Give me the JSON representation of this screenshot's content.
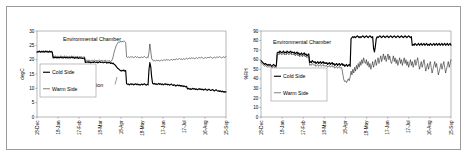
{
  "figure": {
    "title": "",
    "panels": [
      "temperature",
      "humidity"
    ]
  },
  "chart_data": [
    {
      "id": "temperature",
      "type": "line",
      "title": "",
      "annotation_chamber": "Environmental Chamber",
      "annotation_event": "Add partition",
      "xlabel": "",
      "ylabel": "degC",
      "ylim": [
        0,
        30
      ],
      "yticks": [
        0,
        5,
        10,
        15,
        20,
        25,
        30
      ],
      "ytick_labels": [
        "0",
        "5",
        "10",
        "15",
        "20",
        "25",
        "30"
      ],
      "xtick_labels": [
        "18-Dec",
        "18-Jan",
        "17-Feb",
        "18-Mar",
        "18-Apr",
        "18-May",
        "17-Jun",
        "17-Jul",
        "16-Aug",
        "15-Sep"
      ],
      "grid": false,
      "legend_position": "center-left",
      "series": [
        {
          "name": "Cold Side",
          "style": "thick",
          "values": [
            22.6,
            22.8,
            22.7,
            22.9,
            22.6,
            22.8,
            22.7,
            22.9,
            22.6,
            22.8,
            22.9,
            22.7,
            22.8,
            22.6,
            22.9,
            22.7,
            22.8,
            22.6,
            20.6,
            20.8,
            20.7,
            20.9,
            20.6,
            20.8,
            20.7,
            20.6,
            20.9,
            20.7,
            20.8,
            20.6,
            20.7,
            20.9,
            20.6,
            20.8,
            20.7,
            20.6,
            20.8,
            20.6,
            20.7,
            20.9,
            20.6,
            20.8,
            20.5,
            20.7,
            20.6,
            20.8,
            20.4,
            20.6,
            20.7,
            20.5,
            20.6,
            20.4,
            20.5,
            20.6,
            19.0,
            19.2,
            19.1,
            19.3,
            19.0,
            19.2,
            18.9,
            19.1,
            19.2,
            19.0,
            19.3,
            19.1,
            19.0,
            19.2,
            18.9,
            19.1,
            19.3,
            19.0,
            19.1,
            19.2,
            18.9,
            19.0,
            19.2,
            19.1,
            18.8,
            19.0,
            18.9,
            19.1,
            18.7,
            18.9,
            18.6,
            18.8,
            18.4,
            18.2,
            17.8,
            17.4,
            17.0,
            16.8,
            16.5,
            16.2,
            16.0,
            16.3,
            16.1,
            16.4,
            16.0,
            16.2,
            11.6,
            11.4,
            11.5,
            11.2,
            11.4,
            11.6,
            11.3,
            11.5,
            11.2,
            11.4,
            11.6,
            11.3,
            11.5,
            11.2,
            11.4,
            11.1,
            11.3,
            11.5,
            11.2,
            11.4,
            11.6,
            11.3,
            11.1,
            11.4,
            11.2,
            16.5,
            19.0,
            17.5,
            14.0,
            11.8,
            11.5,
            11.7,
            11.4,
            11.6,
            11.3,
            11.5,
            11.7,
            11.4,
            11.6,
            11.3,
            11.5,
            11.2,
            11.4,
            11.6,
            11.3,
            11.5,
            11.2,
            11.4,
            11.1,
            11.3,
            11.5,
            11.2,
            11.0,
            11.3,
            11.1,
            10.8,
            11.0,
            11.2,
            10.9,
            11.1,
            10.8,
            11.0,
            10.7,
            10.9,
            10.6,
            10.8,
            10.5,
            10.7,
            9.8,
            10.0,
            9.7,
            9.9,
            9.6,
            9.8,
            10.0,
            9.7,
            9.9,
            9.6,
            9.8,
            9.5,
            9.7,
            9.9,
            9.6,
            9.8,
            9.5,
            9.7,
            9.4,
            9.6,
            9.8,
            9.5,
            9.3,
            9.5,
            9.7,
            9.4,
            9.2,
            9.4,
            9.6,
            9.3,
            9.1,
            9.3,
            9.5,
            9.2,
            9.0,
            9.2,
            8.9,
            9.1,
            8.8,
            9.0,
            8.7,
            8.9,
            8.6,
            8.8
          ]
        },
        {
          "name": "Warm Side",
          "style": "thin",
          "values": [
            22.8,
            23.0,
            22.9,
            23.1,
            22.8,
            23.0,
            22.9,
            23.1,
            22.8,
            23.0,
            23.1,
            22.9,
            23.0,
            22.8,
            23.1,
            22.9,
            23.0,
            22.8,
            21.0,
            21.2,
            21.1,
            21.3,
            21.0,
            21.2,
            21.1,
            21.0,
            21.3,
            21.1,
            21.2,
            21.0,
            21.1,
            21.3,
            21.0,
            21.2,
            21.1,
            21.0,
            21.2,
            21.0,
            21.1,
            21.3,
            21.0,
            21.2,
            20.9,
            21.1,
            21.0,
            21.2,
            20.8,
            21.0,
            21.1,
            20.9,
            21.0,
            20.8,
            20.9,
            21.0,
            19.6,
            19.8,
            19.7,
            19.9,
            19.6,
            19.8,
            19.5,
            19.7,
            19.8,
            19.6,
            19.9,
            19.7,
            19.6,
            19.8,
            19.5,
            19.7,
            19.9,
            19.6,
            19.7,
            19.8,
            19.5,
            19.6,
            19.8,
            19.7,
            19.4,
            19.6,
            19.5,
            19.7,
            19.3,
            19.5,
            20.0,
            21.0,
            22.5,
            23.5,
            24.5,
            25.2,
            25.8,
            26.2,
            26.0,
            26.4,
            26.1,
            26.5,
            26.2,
            26.6,
            26.3,
            26.0,
            21.0,
            20.8,
            21.0,
            20.7,
            20.9,
            21.1,
            20.8,
            21.0,
            20.7,
            20.9,
            21.1,
            20.8,
            21.0,
            20.7,
            20.9,
            20.6,
            20.8,
            21.0,
            20.7,
            20.9,
            21.1,
            20.8,
            20.6,
            20.9,
            20.7,
            22.5,
            25.5,
            23.0,
            20.5,
            19.8,
            19.6,
            19.8,
            19.5,
            19.7,
            19.9,
            19.6,
            19.8,
            19.5,
            19.7,
            19.9,
            19.6,
            19.8,
            20.0,
            19.7,
            19.9,
            20.1,
            19.8,
            20.0,
            19.7,
            19.9,
            20.1,
            19.8,
            20.0,
            20.2,
            19.9,
            20.1,
            20.3,
            20.0,
            20.2,
            20.4,
            20.1,
            20.3,
            20.0,
            20.2,
            20.4,
            20.1,
            20.3,
            20.5,
            20.2,
            20.4,
            20.6,
            20.3,
            20.5,
            20.7,
            20.4,
            20.6,
            20.3,
            20.5,
            20.7,
            20.4,
            20.6,
            20.8,
            20.5,
            20.7,
            20.9,
            20.6,
            20.4,
            20.6,
            20.8,
            20.5,
            20.7,
            20.9,
            20.6,
            20.8,
            21.0,
            20.7,
            20.5,
            20.7,
            20.9,
            20.6,
            20.8,
            21.0,
            20.7,
            20.9,
            21.1,
            20.8,
            20.6,
            20.8,
            21.0,
            20.7,
            20.9,
            21.1
          ]
        }
      ]
    },
    {
      "id": "humidity",
      "type": "line",
      "title": "",
      "annotation_chamber": "Environmental Chamber",
      "xlabel": "",
      "ylabel": "%RH",
      "ylim": [
        0,
        90
      ],
      "yticks": [
        0,
        10,
        20,
        30,
        40,
        50,
        60,
        70,
        80,
        90
      ],
      "ytick_labels": [
        "0",
        "10",
        "20",
        "30",
        "40",
        "50",
        "60",
        "70",
        "80",
        "90"
      ],
      "xtick_labels": [
        "18-Dec",
        "18-Jan",
        "17-Feb",
        "18-Mar",
        "18-Apr",
        "18-May",
        "17-Jun",
        "17-Jul",
        "16-Aug",
        "15-Sep"
      ],
      "grid": false,
      "legend_position": "center-left",
      "series": [
        {
          "name": "Cold Side",
          "style": "thick",
          "values": [
            59,
            58,
            57,
            56,
            55,
            56,
            55,
            54,
            55,
            54,
            55,
            54,
            53,
            54,
            55,
            54,
            53,
            54,
            67,
            68,
            67,
            69,
            68,
            67,
            68,
            69,
            67,
            68,
            67,
            69,
            68,
            67,
            68,
            69,
            67,
            68,
            67,
            68,
            66,
            67,
            68,
            66,
            67,
            65,
            66,
            67,
            65,
            66,
            67,
            65,
            66,
            64,
            65,
            66,
            57,
            58,
            57,
            59,
            58,
            57,
            58,
            56,
            57,
            58,
            56,
            57,
            58,
            56,
            57,
            58,
            56,
            57,
            56,
            57,
            55,
            56,
            57,
            55,
            56,
            57,
            55,
            56,
            54,
            55,
            56,
            54,
            55,
            56,
            54,
            55,
            56,
            54,
            55,
            53,
            54,
            55,
            53,
            54,
            55,
            53,
            82,
            83,
            84,
            83,
            84,
            83,
            84,
            85,
            84,
            83,
            84,
            83,
            84,
            85,
            84,
            83,
            84,
            85,
            84,
            83,
            84,
            85,
            84,
            83,
            84,
            72,
            68,
            74,
            82,
            84,
            83,
            84,
            85,
            84,
            83,
            84,
            85,
            84,
            83,
            84,
            85,
            84,
            83,
            84,
            85,
            84,
            83,
            84,
            85,
            84,
            83,
            84,
            85,
            84,
            83,
            84,
            85,
            84,
            83,
            84,
            85,
            84,
            83,
            84,
            85,
            84,
            83,
            84,
            75,
            76,
            75,
            77,
            76,
            75,
            76,
            77,
            75,
            76,
            77,
            75,
            76,
            77,
            75,
            76,
            77,
            75,
            76,
            75,
            77,
            76,
            75,
            76,
            77,
            75,
            76,
            77,
            75,
            76,
            77,
            75,
            76,
            77,
            75,
            76,
            77,
            75,
            76,
            77,
            75,
            76,
            77,
            75
          ]
        },
        {
          "name": "Warm Side",
          "style": "thin",
          "values": [
            57,
            56,
            55,
            54,
            53,
            54,
            53,
            52,
            53,
            52,
            53,
            52,
            51,
            52,
            53,
            52,
            51,
            52,
            65,
            66,
            65,
            67,
            66,
            65,
            66,
            67,
            65,
            66,
            65,
            67,
            66,
            65,
            66,
            67,
            65,
            66,
            65,
            66,
            64,
            65,
            66,
            64,
            65,
            63,
            64,
            65,
            63,
            64,
            65,
            63,
            64,
            62,
            63,
            64,
            54,
            55,
            54,
            56,
            55,
            54,
            55,
            53,
            54,
            55,
            53,
            54,
            55,
            53,
            54,
            55,
            53,
            54,
            53,
            54,
            52,
            53,
            54,
            52,
            53,
            54,
            52,
            53,
            51,
            52,
            53,
            51,
            52,
            53,
            51,
            52,
            50,
            44,
            39,
            37,
            38,
            36,
            38,
            40,
            38,
            42,
            48,
            44,
            50,
            46,
            52,
            48,
            54,
            50,
            56,
            52,
            58,
            54,
            60,
            56,
            62,
            58,
            56,
            60,
            54,
            58,
            52,
            56,
            50,
            54,
            58,
            52,
            56,
            60,
            54,
            58,
            62,
            56,
            60,
            64,
            58,
            62,
            66,
            60,
            64,
            58,
            62,
            66,
            60,
            64,
            58,
            56,
            60,
            64,
            58,
            62,
            56,
            60,
            54,
            58,
            62,
            56,
            60,
            54,
            58,
            62,
            56,
            60,
            54,
            58,
            52,
            56,
            60,
            54,
            58,
            52,
            56,
            60,
            54,
            58,
            62,
            56,
            50,
            54,
            58,
            52,
            56,
            60,
            54,
            48,
            52,
            56,
            50,
            54,
            58,
            52,
            46,
            50,
            54,
            58,
            52,
            56,
            50,
            44,
            48,
            52,
            56,
            50,
            54,
            58,
            52,
            46,
            50,
            54,
            58,
            52,
            56,
            60
          ]
        }
      ]
    }
  ]
}
